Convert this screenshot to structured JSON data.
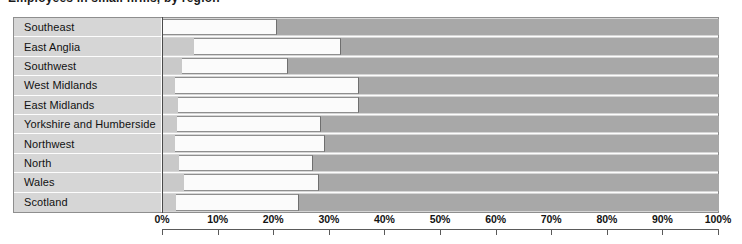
{
  "title_sliver": "Employees in small firms, by region",
  "chart_data": {
    "type": "bar",
    "orientation": "horizontal",
    "stacked": true,
    "title": "",
    "xlabel": "",
    "ylabel": "",
    "xlim": [
      0,
      100
    ],
    "grid": false,
    "legend_position": "none",
    "tick_labels": [
      "0%",
      "10%",
      "20%",
      "30%",
      "40%",
      "50%",
      "60%",
      "70%",
      "80%",
      "90%",
      "100%"
    ],
    "tick_values": [
      0,
      10,
      20,
      30,
      40,
      50,
      60,
      70,
      80,
      90,
      100
    ],
    "categories": [
      "Southeast",
      "East Anglia",
      "Southwest",
      "West Midlands",
      "East Midlands",
      "Yorkshire and  Humberside",
      "Northwest",
      "North",
      "Wales",
      "Scotland"
    ],
    "series": [
      {
        "name": "segment-a",
        "color": "#c9c9c9",
        "values": [
          0.0,
          5.5,
          3.4,
          2.2,
          2.7,
          2.5,
          2.2,
          2.9,
          3.8,
          2.3
        ]
      },
      {
        "name": "segment-b",
        "color": "#fbfbfb",
        "values": [
          20.5,
          26.5,
          19.1,
          33.1,
          32.6,
          25.9,
          27.0,
          24.1,
          24.2,
          22.2
        ]
      },
      {
        "name": "segment-c",
        "color": "#a8a8a8",
        "values": [
          79.5,
          68.0,
          77.5,
          64.7,
          64.7,
          71.6,
          70.8,
          73.0,
          72.0,
          75.5
        ]
      }
    ],
    "cumulative_breakpoints": [
      [
        0.0,
        20.5
      ],
      [
        5.5,
        32.0
      ],
      [
        3.4,
        22.5
      ],
      [
        2.2,
        35.3
      ],
      [
        2.7,
        35.3
      ],
      [
        2.5,
        28.4
      ],
      [
        2.2,
        29.2
      ],
      [
        2.9,
        27.0
      ],
      [
        3.8,
        28.0
      ],
      [
        2.3,
        24.5
      ]
    ]
  }
}
